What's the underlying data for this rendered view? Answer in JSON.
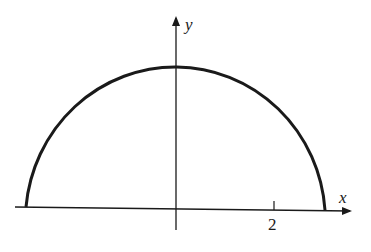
{
  "diagram": {
    "type": "semicircle-graph",
    "axes": {
      "x_label": "x",
      "y_label": "y",
      "ticks": [
        {
          "value": 2,
          "label": "2"
        }
      ]
    },
    "curve": {
      "description": "upper half of circle centered at origin",
      "x_range": [
        -3,
        3
      ],
      "y_max": 3
    },
    "colors": {
      "stroke": "#1a1a1a",
      "background": "#ffffff"
    }
  }
}
